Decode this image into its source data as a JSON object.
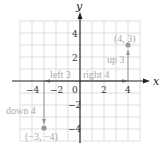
{
  "figure": {
    "axes": {
      "x_label": "x",
      "y_label": "y",
      "x_ticks": [
        {
          "value": -4,
          "label": "−4"
        },
        {
          "value": -2,
          "label": "−2"
        },
        {
          "value": 0,
          "label": "0"
        },
        {
          "value": 2,
          "label": "2"
        },
        {
          "value": 4,
          "label": "4"
        }
      ],
      "y_ticks": [
        {
          "value": 4,
          "label": "4"
        },
        {
          "value": 2,
          "label": "2"
        },
        {
          "value": -2,
          "label": "−2"
        },
        {
          "value": -4,
          "label": "−4"
        }
      ],
      "range": {
        "x": [
          -5,
          5
        ],
        "y": [
          -5,
          5
        ]
      },
      "grid": true
    },
    "points": [
      {
        "x": 4,
        "y": 3,
        "label": "(4, 3)"
      },
      {
        "x": -3,
        "y": -4,
        "label": "(−3, −4)"
      }
    ],
    "annotations": {
      "right": "right 4",
      "up": "up 3",
      "left": "left 3",
      "down": "down 4"
    },
    "colors": {
      "axis": "#222222",
      "grid": "#dddddd",
      "annotation": "#aaaaaa",
      "point": "#999999"
    }
  }
}
